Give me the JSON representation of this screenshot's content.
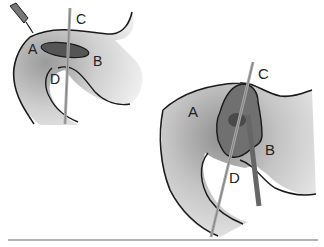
{
  "figure": {
    "small_view": {
      "labels": {
        "a": "A",
        "b": "B",
        "c": "C",
        "d": "D"
      }
    },
    "large_view": {
      "labels": {
        "a": "A",
        "b": "B",
        "c": "C",
        "d": "D"
      }
    }
  },
  "colors": {
    "outline": "#1a1a1a",
    "shade_light": "#d8d8d8",
    "shade_mid": "#a8a8a8",
    "lesion": "#555555",
    "baseline": "#666666"
  }
}
